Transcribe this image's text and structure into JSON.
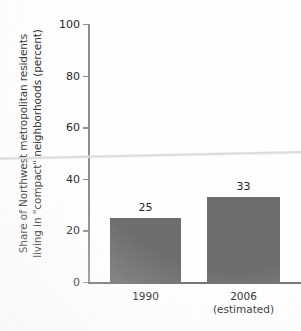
{
  "chart_data": {
    "type": "bar",
    "title": "",
    "subtitle": "",
    "xlabel": "",
    "ylabel": "Share of Northwest metropolitan residents\nliving in \"compact\" neighborhoods (percent)",
    "categories": [
      "1990",
      "2006\n(estimated)"
    ],
    "values": [
      25,
      33
    ],
    "data_labels": [
      "25",
      "33"
    ],
    "ylim": [
      0,
      100
    ],
    "yticks": [
      0,
      20,
      40,
      60,
      80,
      100
    ],
    "ytick_labels": [
      "0",
      "20",
      "40",
      "60",
      "80",
      "100"
    ],
    "grid": false,
    "legend": "none",
    "series": [
      {
        "name": "Share of Northwest metropolitan residents living in compact neighborhoods",
        "values": [
          25,
          33
        ]
      }
    ],
    "colors": {
      "bar": "#6e6e6e",
      "axis": "#8d8d8d",
      "text": "#1f1f1f",
      "background": "#fefefe"
    },
    "annotations": [
      {
        "name": "scan-fold-line",
        "text": ""
      }
    ]
  }
}
